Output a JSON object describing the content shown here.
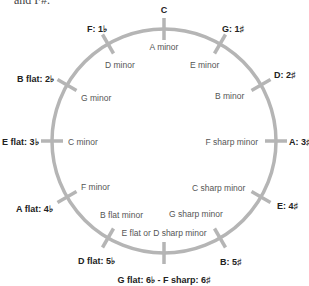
{
  "caption": "and F#.",
  "diagram": {
    "ring_color": "#b5b5b5",
    "major_keys": [
      {
        "label": "C",
        "accidental": ""
      },
      {
        "label": "G: 1",
        "accidental": "♯"
      },
      {
        "label": "D: 2",
        "accidental": "♯"
      },
      {
        "label": "A: 3",
        "accidental": "♯"
      },
      {
        "label": "E: 4",
        "accidental": "♯"
      },
      {
        "label": "B: 5",
        "accidental": "♯"
      },
      {
        "label": "G flat: 6♭ - F sharp: 6",
        "accidental": "♯"
      },
      {
        "label": "D flat: 5",
        "accidental": "♭"
      },
      {
        "label": "A flat: 4",
        "accidental": "♭"
      },
      {
        "label": "E flat: 3",
        "accidental": "♭"
      },
      {
        "label": "B flat: 2",
        "accidental": "♭"
      },
      {
        "label": "F: 1",
        "accidental": "♭"
      }
    ],
    "minor_keys": [
      "A minor",
      "E minor",
      "B minor",
      "F sharp minor",
      "C sharp minor",
      "G sharp minor",
      "E flat or D sharp minor",
      "B flat minor",
      "F minor",
      "C minor",
      "G minor",
      "D minor"
    ]
  }
}
